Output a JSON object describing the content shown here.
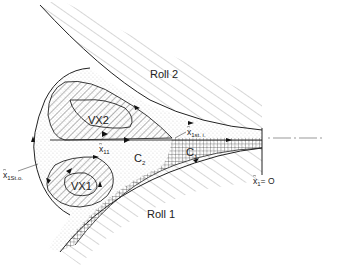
{
  "figure": {
    "labels": {
      "roll2": "Roll 2",
      "roll1": "Roll 1",
      "vx2": "VX2",
      "vx1": "VX1",
      "c1": "C",
      "c1_sub": "1",
      "c2": "C",
      "c2_sub": "2",
      "x11": "x",
      "x11_sub": "11",
      "x1st_i": "x",
      "x1st_i_sub": "1st. i.",
      "x1st_o": "x",
      "x1st_o_sub": "1St.o.",
      "x1_zero": "x",
      "x1_zero_sub": "1",
      "x1_zero_eq": "= O"
    },
    "regions": {
      "vortex_fill": "diagonal-hatch",
      "inflow_fill": "dotted",
      "film_fill": "cross-hatch"
    },
    "colors": {
      "line": "#222222",
      "background": "#ffffff"
    }
  }
}
